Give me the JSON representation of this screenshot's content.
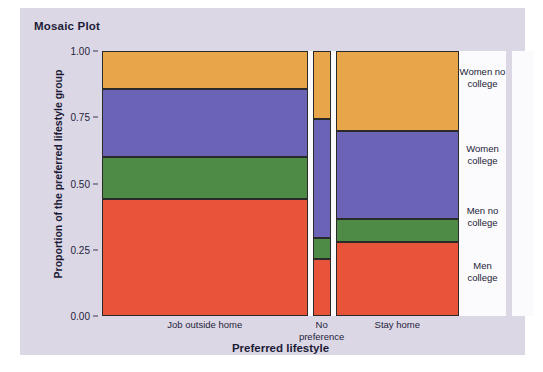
{
  "figure": {
    "title": "Mosaic Plot",
    "background_color": "#dcd7e4",
    "panel_color": "#fbfafc"
  },
  "chart_data": {
    "type": "mosaic",
    "title": "Mosaic Plot",
    "xlabel": "Preferred lifestyle",
    "ylabel": "Proportion of the preferred lifestyle group",
    "ylim": [
      0.0,
      1.0
    ],
    "grid": false,
    "legend_position": "right",
    "ytick_labels": [
      "0.00",
      "0.25",
      "0.50",
      "0.75",
      "1.00"
    ],
    "ytick_values": [
      0.0,
      0.25,
      0.5,
      0.75,
      1.0
    ],
    "categories": [
      "Job outside home",
      "No preference",
      "Stay home"
    ],
    "category_widths": [
      0.5775,
      0.0505,
      0.3465
    ],
    "series": [
      {
        "name": "Men college",
        "color": "#e8543a",
        "values": [
          0.44,
          0.215,
          0.28
        ]
      },
      {
        "name": "Men no college",
        "color": "#4e8b47",
        "values": [
          0.16,
          0.08,
          0.085
        ]
      },
      {
        "name": "Women college",
        "color": "#6b63b5",
        "values": [
          0.255,
          0.45,
          0.335
        ]
      },
      {
        "name": "Women no college",
        "color": "#e8a64a",
        "values": [
          0.145,
          0.255,
          0.3
        ]
      }
    ],
    "overall_proportions": {
      "Men college": 0.33,
      "Men no college": 0.085,
      "Women college": 0.385,
      "Women no college": 0.2
    },
    "legend_entries": [
      {
        "label": "Women no college",
        "color": "#e8a64a",
        "center": 0.9
      },
      {
        "label": "Women college",
        "color": "#6b63b5",
        "center": 0.608
      },
      {
        "label": "Men no college",
        "color": "#4e8b47",
        "center": 0.373
      },
      {
        "label": "Men college",
        "color": "#e8543a",
        "center": 0.165
      }
    ]
  },
  "xtick_labels": [
    {
      "line1": "Job outside home",
      "line2": ""
    },
    {
      "line1": "No",
      "line2": "preference"
    },
    {
      "line1": "Stay home",
      "line2": ""
    }
  ]
}
